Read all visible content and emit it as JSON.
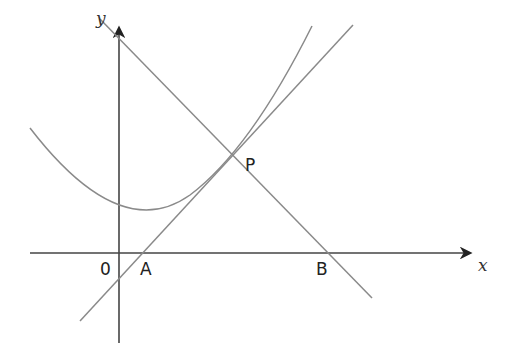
{
  "diagram": {
    "axes": {
      "x_label": "x",
      "y_label": "y"
    },
    "points": {
      "origin": "0",
      "A": "A",
      "B": "B",
      "P": "P"
    },
    "elements": [
      {
        "type": "curve",
        "description": "parabola, minimum just right of the y-axis"
      },
      {
        "type": "line",
        "description": "tangent to curve at P through A"
      },
      {
        "type": "line",
        "description": "line through P and B with negative gradient"
      }
    ],
    "colors": {
      "curves": "#8a8a8a",
      "axes": "#333333"
    }
  }
}
